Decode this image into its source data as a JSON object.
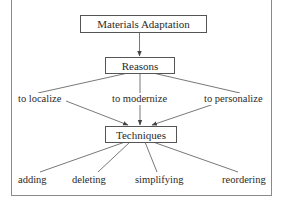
{
  "diagram": {
    "root": {
      "label": "Materials Adaptation"
    },
    "reasons": {
      "label": "Reasons",
      "items": [
        {
          "label": "to localize"
        },
        {
          "label": "to modernize"
        },
        {
          "label": "to personalize"
        }
      ]
    },
    "techniques": {
      "label": "Techniques",
      "items": [
        {
          "label": "adding"
        },
        {
          "label": "deleting"
        },
        {
          "label": "simplifying"
        },
        {
          "label": "reordering"
        }
      ]
    },
    "edges": [
      {
        "from": "Materials Adaptation",
        "to": "Reasons",
        "arrow": true
      },
      {
        "from": "Reasons",
        "to": "to localize",
        "arrow": false
      },
      {
        "from": "Reasons",
        "to": "to modernize",
        "arrow": false
      },
      {
        "from": "Reasons",
        "to": "to personalize",
        "arrow": false
      },
      {
        "from": "to localize",
        "to": "Techniques",
        "arrow": true
      },
      {
        "from": "to modernize",
        "to": "Techniques",
        "arrow": true
      },
      {
        "from": "to personalize",
        "to": "Techniques",
        "arrow": true
      },
      {
        "from": "Techniques",
        "to": "adding",
        "arrow": false
      },
      {
        "from": "Techniques",
        "to": "deleting",
        "arrow": false
      },
      {
        "from": "Techniques",
        "to": "simplifying",
        "arrow": false
      },
      {
        "from": "Techniques",
        "to": "reordering",
        "arrow": false
      }
    ],
    "colors": {
      "line": "#555555",
      "text": "#2a2a2a",
      "frame": "#8a8a8a",
      "background": "#ffffff"
    }
  }
}
